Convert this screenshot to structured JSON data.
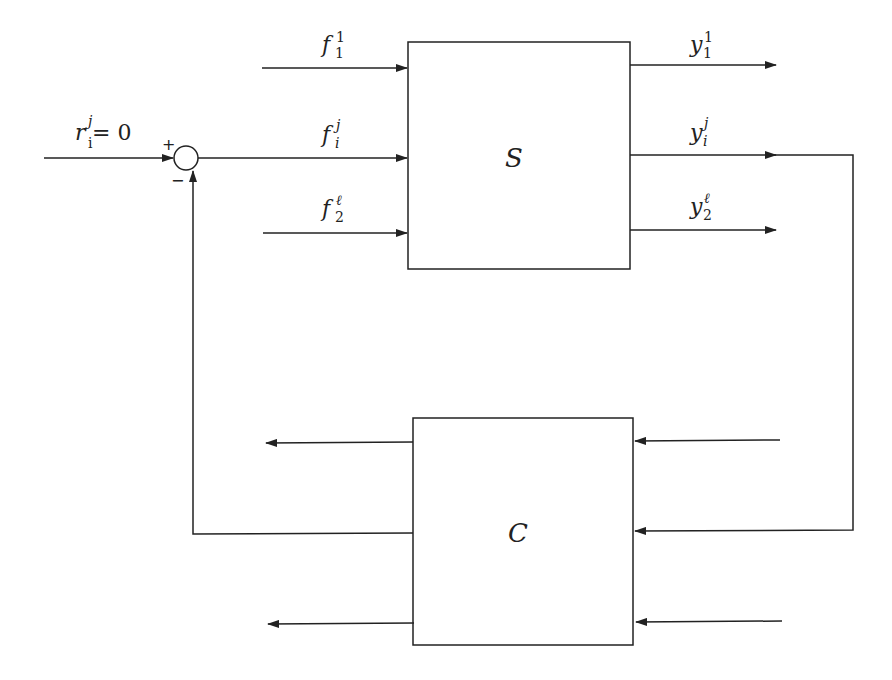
{
  "diagram": {
    "type": "block-diagram",
    "blocks": {
      "plant": {
        "label": "S"
      },
      "controller": {
        "label": "C"
      }
    },
    "summing_junction": {
      "plus_sign": "+",
      "minus_sign": "−"
    },
    "reference": {
      "base": "r",
      "sub": "i",
      "sup": "j",
      "suffix": " = 0"
    },
    "inputs": [
      {
        "base": "f",
        "sub": "1",
        "sup": "1"
      },
      {
        "base": "f",
        "sub": "i",
        "sup": "j"
      },
      {
        "base": "f",
        "sub": "2",
        "sup": "ℓ"
      }
    ],
    "outputs": [
      {
        "base": "y",
        "sub": "1",
        "sup": "1"
      },
      {
        "base": "y",
        "sub": "i",
        "sup": "j"
      },
      {
        "base": "y",
        "sub": "2",
        "sup": "ℓ"
      }
    ],
    "colors": {
      "line": "#222222",
      "background": "#ffffff"
    }
  }
}
